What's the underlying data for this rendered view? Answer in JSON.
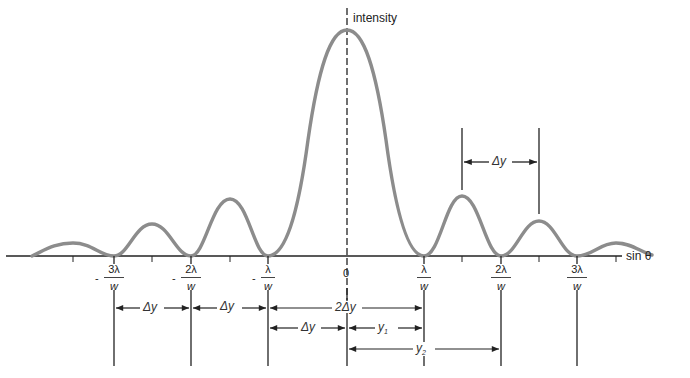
{
  "diagram": {
    "axes": {
      "y_label": "intensity",
      "x_label": "sin θ",
      "origin_label": "0"
    },
    "ticks": [
      {
        "sign": "-",
        "num": "3λ",
        "den": "w"
      },
      {
        "sign": "-",
        "num": "2λ",
        "den": "w"
      },
      {
        "sign": "-",
        "num": "λ",
        "den": "w"
      },
      {
        "sign": "",
        "num": "λ",
        "den": "w"
      },
      {
        "sign": "",
        "num": "2λ",
        "den": "w"
      },
      {
        "sign": "",
        "num": "3λ",
        "den": "w"
      }
    ],
    "dimensions": {
      "peak_spacing": "Δy",
      "left_outer": "Δy",
      "left_inner": "Δy",
      "central_width": "2Δy",
      "half_central": "Δy",
      "y1": "y",
      "y1_sub": "1",
      "y2": "y",
      "y2_sub": "2"
    },
    "colors": {
      "curve": "#8c8c8c",
      "lines": "#222222",
      "background": "#ffffff"
    }
  }
}
